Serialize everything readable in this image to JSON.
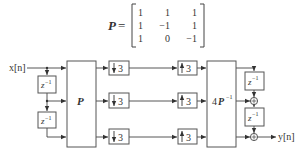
{
  "matrix": {
    "symbol": "P",
    "equals": "=",
    "rows": [
      [
        "1",
        "1",
        "1"
      ],
      [
        "1",
        "−1",
        "1"
      ],
      [
        "1",
        "0",
        "−1"
      ]
    ]
  },
  "diagram": {
    "input_label": "x[n]",
    "output_label": "y[n]",
    "analysis_block": "P",
    "synthesis_block_prefix": "4",
    "synthesis_block_symbol": "P",
    "synthesis_block_exponent": "−1",
    "delay_base": "z",
    "delay_exponent": "−1",
    "downsample_factor": "3",
    "upsample_factor": "3",
    "adder_symbol": "+",
    "branches": 3
  },
  "colors": {
    "line": "#444444",
    "box_fill": "#ffffff",
    "text": "#333333"
  }
}
